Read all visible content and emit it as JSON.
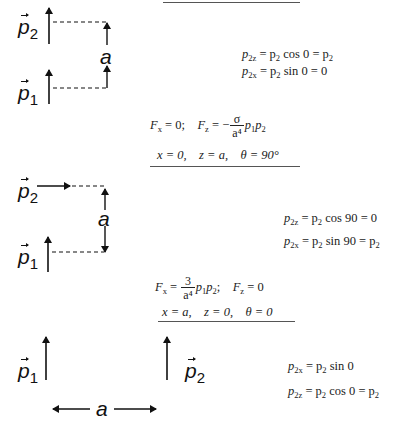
{
  "top_rule": true,
  "case1": {
    "labels": {
      "p2": "p",
      "p2_sub": "2",
      "p1": "p",
      "p1_sub": "1",
      "a": "a"
    },
    "eq1": {
      "lhs": "p",
      "lhs_sub": "2z",
      "mid": " = p",
      "mid_sub": "2",
      "func": " cos 0 = p",
      "rhs_sub": "2"
    },
    "eq2": {
      "lhs": "p",
      "lhs_sub": "2x",
      "mid": " = p",
      "mid_sub": "2",
      "func": " sin 0 = 0"
    },
    "force": {
      "fx": "F",
      "fx_sub": "x",
      "fx_val": " = 0;",
      "fz": "F",
      "fz_sub": "z",
      "fz_eq": " = −",
      "num": "σ",
      "den": "a⁴",
      "tail": "p",
      "tail_sub1": "1",
      "tail_p": "p",
      "tail_sub2": "2"
    },
    "coords": "x = 0,    z = a,    θ = 90°"
  },
  "case2": {
    "labels": {
      "p2": "p",
      "p2_sub": "2",
      "p1": "p",
      "p1_sub": "1",
      "a": "a"
    },
    "eq1": {
      "lhs": "p",
      "lhs_sub": "2z",
      "mid": " = p",
      "mid_sub": "2",
      "func": " cos 90 = 0"
    },
    "eq2": {
      "lhs": "p",
      "lhs_sub": "2x",
      "mid": " = p",
      "mid_sub": "2",
      "func": " sin 90 = p",
      "rhs_sub": "2"
    },
    "force": {
      "fx": "F",
      "fx_sub": "x",
      "fx_eq": " = ",
      "num": "3",
      "den": "a⁴",
      "tail": "p",
      "tail_sub1": "1",
      "tail_p": "p",
      "tail_sub2": "2",
      "semi": ";",
      "fz": "F",
      "fz_sub": "z",
      "fz_val": " = 0"
    },
    "coords": "x = a,    z = 0,    θ = 0"
  },
  "case3": {
    "labels": {
      "p1": "p",
      "p1_sub": "1",
      "p2": "p",
      "p2_sub": "2",
      "a": "a"
    },
    "eq1": {
      "lhs": "p",
      "lhs_sub": "2x",
      "mid": " = p",
      "mid_sub": "2",
      "func": " sin 0"
    },
    "eq2": {
      "lhs": "p",
      "lhs_sub": "2z",
      "mid": " = p",
      "mid_sub": "2",
      "func": " cos 0 = p",
      "rhs_sub": "2"
    }
  },
  "colors": {
    "ink": "#111111",
    "rule": "#555555",
    "background": "#ffffff"
  }
}
